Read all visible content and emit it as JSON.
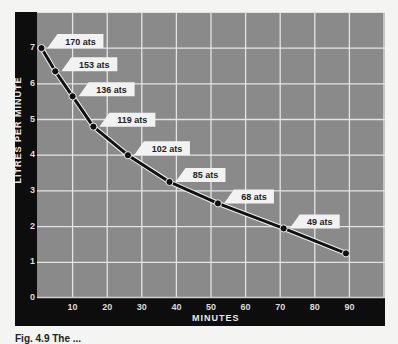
{
  "chart_data": {
    "type": "line",
    "title": "",
    "xlabel": "MINUTES",
    "ylabel": "LITRES PER MINUTE",
    "xlim": [
      0,
      100
    ],
    "ylim": [
      0,
      8
    ],
    "x_ticks": [
      "10",
      "20",
      "30",
      "40",
      "50",
      "60",
      "70",
      "80",
      "90"
    ],
    "y_ticks": [
      "0",
      "1",
      "2",
      "3",
      "4",
      "5",
      "6",
      "7"
    ],
    "grid": true,
    "series": [
      {
        "name": "Air consumption",
        "x": [
          1,
          5,
          10,
          16,
          26,
          38,
          52,
          71,
          89
        ],
        "y": [
          7.0,
          6.35,
          5.65,
          4.8,
          4.0,
          3.25,
          2.65,
          1.95,
          1.25
        ],
        "point_labels": [
          "170 ats",
          "153 ats",
          "136 ats",
          "119 ats",
          "102 ats",
          "85 ats",
          "68 ats",
          "49 ats",
          ""
        ]
      }
    ],
    "annotations": [
      "170 ats",
      "153 ats",
      "136 ats",
      "119 ats",
      "102 ats",
      "85 ats",
      "68 ats",
      "49 ats"
    ]
  },
  "caption": "Fig. 4.9 The ..."
}
